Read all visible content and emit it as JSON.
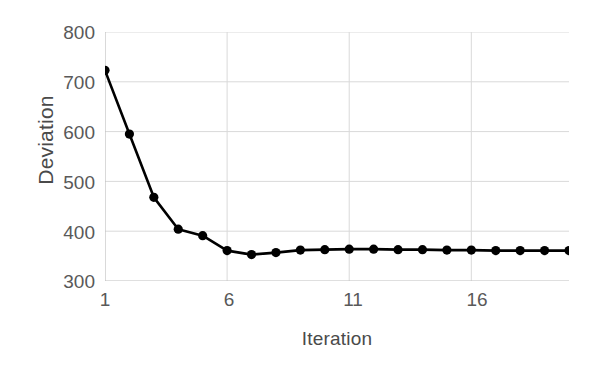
{
  "chart_data": {
    "type": "line",
    "title": "",
    "xlabel": "Iteration",
    "ylabel": "Deviation",
    "x": [
      1,
      2,
      3,
      4,
      5,
      6,
      7,
      8,
      9,
      10,
      11,
      12,
      13,
      14,
      15,
      16,
      17,
      18,
      19,
      20
    ],
    "values": [
      723,
      595,
      468,
      404,
      391,
      361,
      353,
      357,
      362,
      363,
      364,
      364,
      363,
      363,
      362,
      362,
      361,
      361,
      361,
      361
    ],
    "series": [
      {
        "name": "Deviation",
        "values": [
          723,
          595,
          468,
          404,
          391,
          361,
          353,
          357,
          362,
          363,
          364,
          364,
          363,
          363,
          362,
          362,
          361,
          361,
          361,
          361
        ]
      }
    ],
    "xlim": [
      1,
      20
    ],
    "ylim": [
      300,
      800
    ],
    "y_ticks": [
      300,
      400,
      500,
      600,
      700,
      800
    ],
    "x_ticks": [
      1,
      6,
      11,
      16
    ],
    "grid": true,
    "legend": "none",
    "marker": "circle",
    "line_color": "#000000",
    "marker_color": "#000000",
    "grid_color": "#d9d9d9",
    "axis_color": "#bfbfbf",
    "tick_label_color": "#595959",
    "axis_title_color": "#4a4a4a"
  },
  "axes": {
    "y_title": "Deviation",
    "x_title": "Iteration",
    "y_tick_labels": [
      "800",
      "700",
      "600",
      "500",
      "400",
      "300"
    ],
    "x_tick_labels": [
      "1",
      "6",
      "11",
      "16"
    ]
  }
}
